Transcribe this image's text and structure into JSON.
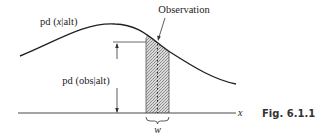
{
  "figure": {
    "caption": "Fig. 6.1.1",
    "labels": {
      "curve": "pd (x|alt)",
      "curve_parts": {
        "pre": "pd (",
        "var": "x",
        "post": "|alt)"
      },
      "height": "pd (obs|alt)",
      "observation": "Observation",
      "axis_variable": "x",
      "width": "w"
    },
    "colors": {
      "line": "#222222",
      "strip_fill": "#c8c8c8",
      "background": "#ffffff"
    }
  }
}
